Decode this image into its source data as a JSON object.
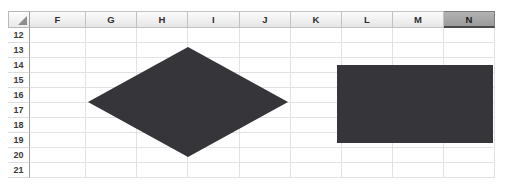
{
  "app": {
    "type": "spreadsheet-grid",
    "name": "Spreadsheet worksheet fragment"
  },
  "grid": {
    "corner_icon": "select-all-triangle-icon",
    "columns": [
      {
        "label": "F",
        "selected": false,
        "width": 56
      },
      {
        "label": "G",
        "selected": false,
        "width": 51
      },
      {
        "label": "H",
        "selected": false,
        "width": 51
      },
      {
        "label": "I",
        "selected": false,
        "width": 52
      },
      {
        "label": "J",
        "selected": false,
        "width": 51
      },
      {
        "label": "K",
        "selected": false,
        "width": 51
      },
      {
        "label": "L",
        "selected": false,
        "width": 51
      },
      {
        "label": "M",
        "selected": false,
        "width": 51
      },
      {
        "label": "N",
        "selected": true,
        "width": 51
      }
    ],
    "rows": [
      {
        "label": "12"
      },
      {
        "label": "13"
      },
      {
        "label": "14"
      },
      {
        "label": "15"
      },
      {
        "label": "16"
      },
      {
        "label": "17"
      },
      {
        "label": "18"
      },
      {
        "label": "19"
      },
      {
        "label": "20"
      },
      {
        "label": "21"
      }
    ],
    "cell_values": [],
    "gridline_color": "#e2e2e2",
    "header_text_color": "#2f2f2f",
    "selected_header_color": "#9a9a9a"
  },
  "shapes": [
    {
      "name": "diamond-shape",
      "type": "diamond",
      "fill": "#35353a",
      "left": 88,
      "top": 47,
      "width": 200,
      "height": 110
    },
    {
      "name": "rectangle-shape",
      "type": "rectangle",
      "fill": "#36363a",
      "left": 337,
      "top": 65,
      "width": 156,
      "height": 78
    }
  ]
}
